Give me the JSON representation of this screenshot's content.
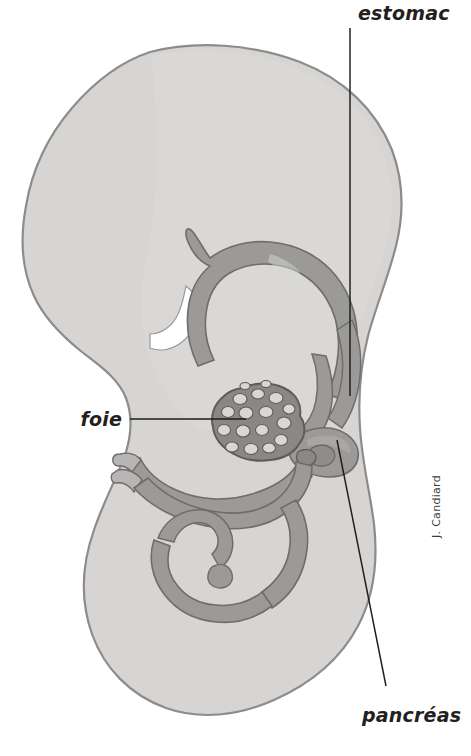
{
  "figure": {
    "background_color": "#ffffff",
    "width": 471,
    "height": 756
  },
  "palette": {
    "body_fill": "#d6d5d3",
    "body_fill_light": "#dededc",
    "body_outline": "#8e8c8a",
    "gut_fill": "#9b9a98",
    "gut_outline": "#6e6d6b",
    "liver_fill": "#8a8886",
    "liver_outline": "#5d5c5a",
    "cavity_fill": "#ffffff",
    "leader_line": "#1c1c1c",
    "label_color": "#231f20",
    "credit_color": "#3d3d3d"
  },
  "labels": [
    {
      "id": "estomac",
      "text": "estomac",
      "anatomy": "stomach",
      "text_x": 358,
      "text_y": 20,
      "anchor": "start",
      "leader_points": "350,28 350,396"
    },
    {
      "id": "foie",
      "text": "foie",
      "anatomy": "liver",
      "text_x": 122,
      "text_y": 426,
      "anchor": "end",
      "leader_points": "130,419 246,419"
    },
    {
      "id": "pancreas",
      "text": "pancréas",
      "anatomy": "pancreas",
      "text_x": 362,
      "text_y": 722,
      "anchor": "start",
      "leader_points": "337,440 386,686"
    }
  ],
  "credit": {
    "text": "J. Candiard",
    "x": 440,
    "y": 538,
    "rotation": -90
  },
  "structures": [
    {
      "id": "embryo-body",
      "name": "embryo-body-silhouette"
    },
    {
      "id": "head-mass",
      "name": "head-region"
    },
    {
      "id": "pericardial-cavity",
      "name": "pericardial-cavity"
    },
    {
      "id": "foregut-arch",
      "name": "foregut-pharyngeal-arch"
    },
    {
      "id": "stomach",
      "name": "stomach"
    },
    {
      "id": "esophagus",
      "name": "esophagus"
    },
    {
      "id": "duodenum",
      "name": "duodenum"
    },
    {
      "id": "pancreas-bud",
      "name": "pancreatic-bud"
    },
    {
      "id": "liver-mass",
      "name": "liver-lobules"
    },
    {
      "id": "midgut-loop",
      "name": "midgut-loop"
    },
    {
      "id": "vitelline-duct",
      "name": "vitelline-duct"
    },
    {
      "id": "hindgut",
      "name": "hindgut-coil"
    },
    {
      "id": "tail",
      "name": "tail-region"
    }
  ]
}
